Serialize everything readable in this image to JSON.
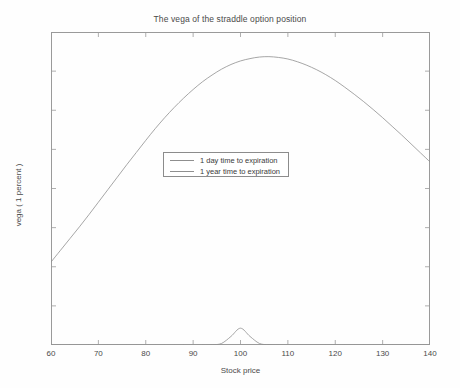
{
  "chart_data": {
    "type": "line",
    "title": "The vega of the straddle option position",
    "xlabel": "Stock price",
    "ylabel": "vega ( 1 percent )",
    "xlim": [
      60,
      140
    ],
    "ylim": [
      0,
      0.8
    ],
    "xticks": [
      60,
      70,
      80,
      90,
      100,
      110,
      120,
      130,
      140
    ],
    "xtick_labels": [
      "60",
      "70",
      "80",
      "90",
      "100",
      "110",
      "120",
      "130",
      "140"
    ],
    "yticks": [
      0,
      0.1,
      0.2,
      0.3,
      0.4,
      0.5,
      0.6,
      0.7,
      0.8
    ],
    "ytick_labels": [
      "0",
      "0.1",
      "0.2",
      "0.3",
      "0.4",
      "0.5",
      "0.6",
      "0.7",
      "0.8"
    ],
    "grid": false,
    "legend_position": "center",
    "line_color": "#8f8f8f",
    "axis_color": "#9a9a9a",
    "background_color": "#ffffff",
    "x": [
      60,
      62,
      64,
      66,
      68,
      70,
      72,
      74,
      76,
      78,
      80,
      82,
      84,
      86,
      88,
      90,
      92,
      94,
      96,
      98,
      100,
      102,
      104,
      106,
      108,
      110,
      112,
      114,
      116,
      118,
      120,
      122,
      124,
      126,
      128,
      130,
      132,
      134,
      136,
      138,
      140
    ],
    "series": [
      {
        "name": "1 day time to expiration",
        "values": [
          0,
          0,
          0,
          0,
          0,
          0,
          0,
          0,
          0,
          0,
          0,
          0,
          0,
          0,
          0,
          0,
          0,
          0.0005,
          0.004,
          0.022,
          0.043,
          0.022,
          0.004,
          0.0005,
          0,
          0,
          0,
          0,
          0,
          0,
          0,
          0,
          0,
          0,
          0,
          0,
          0,
          0,
          0,
          0,
          0
        ]
      },
      {
        "name": "1 year time to expiration",
        "values": [
          0.212,
          0.242,
          0.272,
          0.302,
          0.333,
          0.365,
          0.397,
          0.429,
          0.461,
          0.492,
          0.523,
          0.553,
          0.581,
          0.607,
          0.631,
          0.653,
          0.673,
          0.69,
          0.705,
          0.717,
          0.726,
          0.732,
          0.736,
          0.737,
          0.735,
          0.731,
          0.724,
          0.715,
          0.704,
          0.691,
          0.676,
          0.659,
          0.641,
          0.622,
          0.602,
          0.581,
          0.559,
          0.537,
          0.514,
          0.491,
          0.468
        ]
      }
    ],
    "annotations": {
      "peak_value": 0.737,
      "peak_x": 106,
      "day_peak_value": 0.043,
      "day_peak_x": 100
    }
  },
  "legend": {
    "entries": [
      {
        "label": "1 day time to expiration"
      },
      {
        "label": "1 year time to expiration"
      }
    ]
  }
}
